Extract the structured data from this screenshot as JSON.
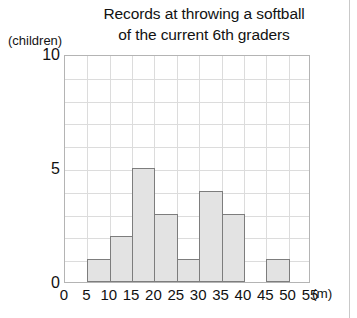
{
  "chart_data": {
    "type": "bar",
    "title": "Records at throwing a softball of the current 6th graders",
    "title_lines": [
      "Records at throwing a softball",
      "of the current 6th graders"
    ],
    "xlabel": "(m)",
    "ylabel": "(children)",
    "categories": [
      "0-5",
      "5-10",
      "10-15",
      "15-20",
      "20-25",
      "25-30",
      "30-35",
      "35-40",
      "40-45",
      "45-50",
      "50-55"
    ],
    "values": [
      0,
      1,
      2,
      5,
      3,
      1,
      4,
      3,
      0,
      1,
      0
    ],
    "bin_edges": [
      0,
      5,
      10,
      15,
      20,
      25,
      30,
      35,
      40,
      45,
      50,
      55
    ],
    "xlim": [
      0,
      55
    ],
    "ylim": [
      0,
      10
    ],
    "x_tick_labels": [
      "0",
      "5",
      "10",
      "15",
      "20",
      "25",
      "30",
      "35",
      "40",
      "45",
      "50",
      "55"
    ],
    "y_tick_labels": [
      "0",
      "5",
      "10"
    ],
    "y_tick_values": [
      0,
      5,
      10
    ],
    "y_gridline_step": 1,
    "x_gridline_step": 5,
    "grid": true,
    "legend": false,
    "bar_fill_color": "#e3e3e3",
    "bar_border_color": "#7d7d7d",
    "grid_color": "#dcdcdc",
    "frame_color": "#b4b4b4",
    "background_color": "#ffffff",
    "text_color": "#111111"
  }
}
